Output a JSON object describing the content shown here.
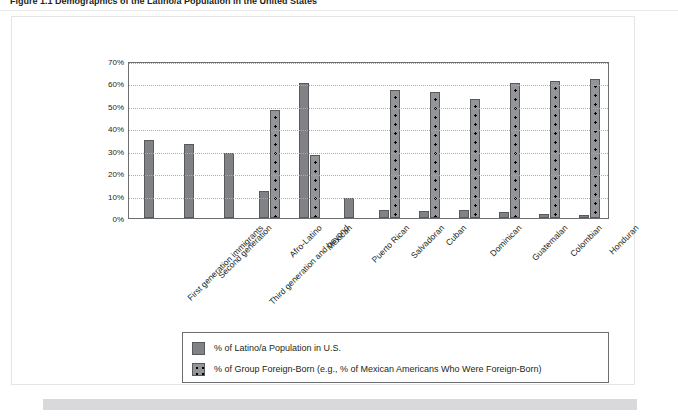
{
  "figure": {
    "caption": "Figure 1.1   Demographics of the Latino/a Population in the United States"
  },
  "chart_data": {
    "type": "bar",
    "title": "",
    "xlabel": "",
    "ylabel": "",
    "ylim": [
      0,
      70
    ],
    "ytick_labels": [
      "70%",
      "60%",
      "50%",
      "40%",
      "30%",
      "20%",
      "10%",
      "0%"
    ],
    "ytick_values": [
      70,
      60,
      50,
      40,
      30,
      20,
      10,
      0
    ],
    "grid": true,
    "legend_position": "bottom",
    "categories": [
      "First generation immigrants",
      "Second generation",
      "Third generation and beyond",
      "Afro-Latino",
      "Mexican",
      "Puerto Rican",
      "Salvadoran",
      "Cuban",
      "Dominican",
      "Guatemalan",
      "Colombian",
      "Honduran"
    ],
    "series": [
      {
        "name": "% of Latino/a Population in U.S.",
        "color": "#808285",
        "pattern": "solid",
        "values": [
          35,
          33,
          29,
          12,
          60,
          9,
          3.5,
          3,
          3.5,
          2.5,
          2,
          1.5
        ]
      },
      {
        "name": "% of Group Foreign-Born (e.g., % of Mexican Americans Who Were Foreign-Born)",
        "color": "#939598",
        "pattern": "dotted",
        "values": [
          null,
          null,
          null,
          48,
          28,
          null,
          57,
          56,
          53,
          60,
          61,
          62
        ]
      }
    ]
  },
  "legend": {
    "items": [
      {
        "label": "% of Latino/a Population in U.S.",
        "swatch": "solid-gray-swatch"
      },
      {
        "label": "% of Group Foreign-Born (e.g., % of Mexican Americans Who Were Foreign-Born)",
        "swatch": "dotted-gray-swatch"
      }
    ]
  }
}
